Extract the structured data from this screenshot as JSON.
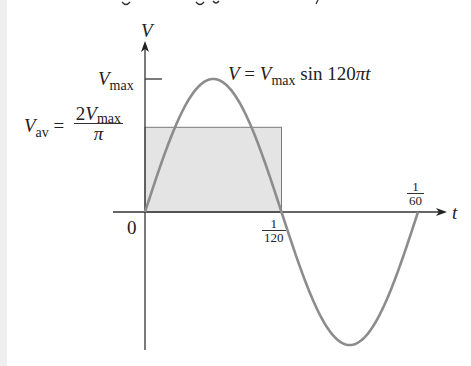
{
  "figure": {
    "axis_labels": {
      "y_axis": "V",
      "x_axis": "t",
      "origin": "0"
    },
    "ticks": {
      "vmax": {
        "main": "V",
        "sub": "max"
      },
      "t_half": {
        "num": "1",
        "den": "120"
      },
      "t_full": {
        "num": "1",
        "den": "60"
      }
    },
    "equation": {
      "lhs": "V",
      "eq": " = ",
      "v": "V",
      "sub": "max",
      "rest": " sin 120",
      "pi": "π",
      "t": "t"
    },
    "average_label": {
      "v": "V",
      "sub": "av",
      "eq": " = ",
      "num_coef": "2",
      "num_v": "V",
      "num_sub": "max",
      "den": "π"
    },
    "colors": {
      "curve": "#8c8c8c",
      "axes": "#333333",
      "rect_fill": "#e4e4e4",
      "rect_stroke": "#7a7a7a"
    }
  },
  "chart_data": {
    "type": "line",
    "title": "V = Vmax sin 120πt",
    "xlabel": "t",
    "ylabel": "V",
    "x_ticks": [
      "0",
      "1/120",
      "1/60"
    ],
    "y_ticks": [
      "Vmax",
      "Vav = 2Vmax/π"
    ],
    "series": [
      {
        "name": "V = Vmax sin 120πt",
        "function": "Vmax*sin(120*pi*t)",
        "x_range": [
          0,
          0.016667
        ],
        "x": [
          0,
          0.002083,
          0.004167,
          0.00625,
          0.008333,
          0.010417,
          0.0125,
          0.014583,
          0.016667
        ],
        "values_normalized": [
          0,
          0.707,
          1,
          0.707,
          0,
          -0.707,
          -1,
          -0.707,
          0
        ]
      }
    ],
    "shaded_region": {
      "name": "average value rectangle",
      "x_range": [
        0,
        0.008333
      ],
      "height_normalized": 0.6366,
      "label": "Vav = 2Vmax/π"
    },
    "ylim_normalized": [
      -1,
      1
    ],
    "grid": false,
    "legend": "none"
  }
}
